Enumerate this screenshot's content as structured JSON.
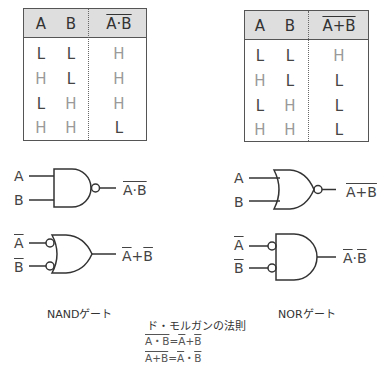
{
  "nand_table": {
    "headers": [
      "A",
      "B",
      "A·B"
    ],
    "output_overlined": true,
    "rows": [
      [
        "L",
        "L",
        "H"
      ],
      [
        "H",
        "L",
        "H"
      ],
      [
        "L",
        "H",
        "H"
      ],
      [
        "H",
        "H",
        "L"
      ]
    ]
  },
  "nor_table": {
    "headers": [
      "A",
      "B",
      "A+B"
    ],
    "output_overlined": true,
    "rows": [
      [
        "L",
        "L",
        "H"
      ],
      [
        "H",
        "L",
        "L"
      ],
      [
        "L",
        "H",
        "L"
      ],
      [
        "H",
        "H",
        "L"
      ]
    ]
  },
  "gates": {
    "nand": {
      "input_a": "A",
      "input_b": "B",
      "output": "A·B",
      "output_overlined": true
    },
    "nand_equiv": {
      "input_a": "A",
      "input_b": "B",
      "inputs_overlined": true,
      "output_a": "A",
      "output_op": "+",
      "output_b": "B"
    },
    "nor": {
      "input_a": "A",
      "input_b": "B",
      "output": "A+B",
      "output_overlined": true
    },
    "nor_equiv": {
      "input_a": "A",
      "input_b": "B",
      "inputs_overlined": true,
      "output_a": "A",
      "output_op": "·",
      "output_b": "B"
    }
  },
  "captions": {
    "nand": "NANDゲート",
    "nor": "NORゲート",
    "de_morgan_title": "ド・モルガンの法則"
  },
  "formulas": [
    {
      "lhs": "A・B",
      "eq": "=",
      "a": "A",
      "op": "+",
      "b": "B"
    },
    {
      "lhs": "A+B",
      "eq": "=",
      "a": "A",
      "op": "・",
      "b": "B"
    }
  ],
  "colors": {
    "line": "#333333",
    "header_bg": "#dedede",
    "H_value": "#9a9a9a",
    "L_value": "#444444"
  }
}
